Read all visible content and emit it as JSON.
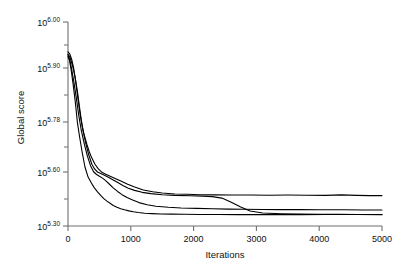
{
  "figure": {
    "title": "",
    "background": "#ffffff",
    "line_color": "#000000",
    "axis_color": "#6f6f6f"
  },
  "axes": {
    "xlabel": "Iterations",
    "ylabel": "Global score",
    "x_ticks": [
      "0",
      "1000",
      "2000",
      "3000",
      "4000",
      "5000"
    ],
    "y_ticks": [
      {
        "base": "10",
        "exp": "6.00"
      },
      {
        "base": "10",
        "exp": "5.90"
      },
      {
        "base": "10",
        "exp": "5.78"
      },
      {
        "base": "10",
        "exp": "5.60"
      },
      {
        "base": "10",
        "exp": "5.30"
      }
    ]
  },
  "chart_data": {
    "type": "line",
    "title": "",
    "xlabel": "Iterations",
    "ylabel": "Global score",
    "xlim": [
      0,
      5000
    ],
    "ylim_exponent": [
      5.3,
      6.0
    ],
    "y_tick_exponents": [
      6.0,
      5.9,
      5.78,
      5.6,
      5.3
    ],
    "y_tick_labels": [
      "10^6.00",
      "10^5.90",
      "10^5.78",
      "10^5.60",
      "10^5.30"
    ],
    "x_ticks": [
      0,
      1000,
      2000,
      3000,
      4000,
      5000
    ],
    "grid": false,
    "legend": null,
    "note": "Four independent optimisation runs; y values are log10 exponents of the global score. Axis tick spacing is non-uniform as printed.",
    "series": [
      {
        "name": "run-1",
        "x": [
          0,
          30,
          60,
          90,
          120,
          160,
          200,
          250,
          300,
          340,
          380,
          430,
          480,
          540,
          600,
          680,
          760,
          850,
          950,
          1050,
          1200,
          1350,
          1500,
          1700,
          1900,
          2100,
          2350,
          2600,
          2900,
          3200,
          3500,
          3800,
          4100,
          4350,
          4600,
          4800,
          5000
        ],
        "y_exp": [
          5.935,
          5.93,
          5.918,
          5.9,
          5.872,
          5.83,
          5.79,
          5.74,
          5.7,
          5.672,
          5.65,
          5.628,
          5.612,
          5.598,
          5.588,
          5.575,
          5.562,
          5.548,
          5.532,
          5.518,
          5.5,
          5.49,
          5.483,
          5.478,
          5.476,
          5.474,
          5.473,
          5.472,
          5.472,
          5.471,
          5.472,
          5.471,
          5.47,
          5.473,
          5.47,
          5.469,
          5.469
        ]
      },
      {
        "name": "run-2",
        "x": [
          0,
          30,
          70,
          110,
          150,
          190,
          230,
          280,
          330,
          380,
          420,
          470,
          520,
          580,
          650,
          720,
          800,
          880,
          960,
          1060,
          1180,
          1320,
          1500,
          1700,
          1950,
          2150,
          2300,
          2450,
          2600,
          2750,
          2900,
          3100,
          3400,
          3700,
          4000,
          4300,
          4600,
          5000
        ],
        "y_exp": [
          5.93,
          5.924,
          5.906,
          5.882,
          5.848,
          5.806,
          5.76,
          5.706,
          5.662,
          5.628,
          5.612,
          5.6,
          5.592,
          5.582,
          5.57,
          5.556,
          5.54,
          5.524,
          5.51,
          5.498,
          5.487,
          5.48,
          5.474,
          5.47,
          5.468,
          5.466,
          5.463,
          5.455,
          5.432,
          5.405,
          5.383,
          5.372,
          5.368,
          5.366,
          5.365,
          5.365,
          5.364,
          5.363
        ]
      },
      {
        "name": "run-3",
        "x": [
          0,
          25,
          55,
          90,
          130,
          170,
          210,
          260,
          310,
          360,
          410,
          455,
          500,
          550,
          600,
          660,
          720,
          790,
          860,
          940,
          1030,
          1130,
          1260,
          1400,
          1600,
          1800,
          2050,
          2300,
          2550,
          2800,
          3100,
          3400,
          3700,
          4000,
          4400,
          4700,
          5000
        ],
        "y_exp": [
          5.928,
          5.92,
          5.9,
          5.872,
          5.836,
          5.796,
          5.752,
          5.7,
          5.656,
          5.622,
          5.6,
          5.586,
          5.576,
          5.566,
          5.552,
          5.532,
          5.512,
          5.492,
          5.474,
          5.458,
          5.444,
          5.43,
          5.418,
          5.41,
          5.404,
          5.4,
          5.398,
          5.396,
          5.394,
          5.393,
          5.392,
          5.391,
          5.391,
          5.39,
          5.39,
          5.389,
          5.389
        ]
      },
      {
        "name": "run-4",
        "x": [
          0,
          25,
          50,
          80,
          115,
          150,
          185,
          225,
          270,
          320,
          370,
          420,
          470,
          520,
          570,
          620,
          670,
          720,
          780,
          840,
          900,
          970,
          1040,
          1120,
          1220,
          1340,
          1480,
          1650,
          1850,
          2100,
          2400,
          2700,
          3000,
          3300,
          3700,
          4100,
          4500,
          5000
        ],
        "y_exp": [
          5.925,
          5.916,
          5.896,
          5.866,
          5.826,
          5.778,
          5.726,
          5.672,
          5.618,
          5.572,
          5.54,
          5.512,
          5.49,
          5.47,
          5.452,
          5.438,
          5.426,
          5.414,
          5.404,
          5.396,
          5.39,
          5.384,
          5.379,
          5.375,
          5.371,
          5.369,
          5.367,
          5.366,
          5.365,
          5.364,
          5.364,
          5.363,
          5.363,
          5.363,
          5.363,
          5.364,
          5.364,
          5.364
        ]
      }
    ]
  }
}
